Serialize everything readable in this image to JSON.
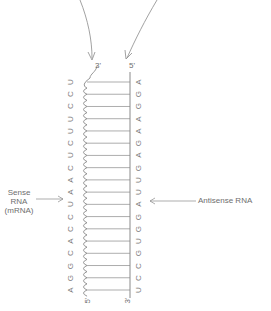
{
  "labels": {
    "sense": [
      "Sense",
      "RNA",
      "(mRNA)"
    ],
    "antisense": "Antisense RNA"
  },
  "sense_strand": {
    "five_prime": "5'",
    "three_prime": "3'",
    "bases_bottom_to_top": [
      "A",
      "G",
      "G",
      "C",
      "A",
      "C",
      "C",
      "U",
      "A",
      "A",
      "C",
      "U",
      "C",
      "U",
      "U",
      "C",
      "C",
      "U"
    ]
  },
  "antisense_strand": {
    "five_prime": "5'",
    "three_prime": "3'",
    "bases_top_to_bottom": [
      "A",
      "G",
      "G",
      "A",
      "A",
      "G",
      "A",
      "G",
      "U",
      "U",
      "A",
      "G",
      "G",
      "U",
      "G",
      "C",
      "C",
      "U"
    ]
  },
  "colors": {
    "line": "#8a8a8a",
    "text": "#6e6e6e"
  }
}
